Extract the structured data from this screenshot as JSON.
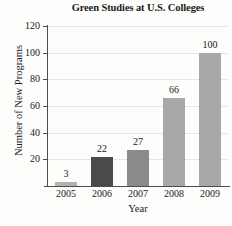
{
  "chart_data": {
    "type": "bar",
    "title": "Green Studies at U.S. Colleges",
    "xlabel": "Year",
    "ylabel": "Number of New Programs",
    "categories": [
      "2005",
      "2006",
      "2007",
      "2008",
      "2009"
    ],
    "values": [
      3,
      22,
      27,
      66,
      100
    ],
    "value_labels": [
      "3",
      "22",
      "27",
      "66",
      "100"
    ],
    "bar_colors": [
      "#b4b2ae",
      "#4a4a4a",
      "#8a8a8a",
      "#a8a8a8",
      "#a8a8a8"
    ],
    "ylim": [
      0,
      120
    ],
    "yticks": [
      0,
      20,
      40,
      60,
      80,
      100,
      120
    ],
    "ytick_labels": [
      "",
      "20",
      "40",
      "60",
      "80",
      "100",
      "120"
    ],
    "grid": true,
    "legend": "none",
    "axis_color": "#4d4d4d",
    "gridline_color": "#e8e6e2",
    "background": "#fdfdfc"
  }
}
